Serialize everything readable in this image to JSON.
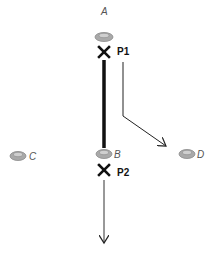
{
  "diagram": {
    "nodes": [
      {
        "id": "A",
        "label": "A",
        "x": 104,
        "y": 37,
        "label_x": 101,
        "label_y": 15
      },
      {
        "id": "B",
        "label": "B",
        "x": 104,
        "y": 154,
        "label_x": 114,
        "label_y": 158
      },
      {
        "id": "C",
        "label": "C",
        "x": 18,
        "y": 156,
        "label_x": 29,
        "label_y": 160
      },
      {
        "id": "D",
        "label": "D",
        "x": 187,
        "y": 154,
        "label_x": 197,
        "label_y": 158
      }
    ],
    "markers": [
      {
        "id": "P1",
        "label": "P1",
        "x": 104,
        "y": 52
      },
      {
        "id": "P2",
        "label": "P2",
        "x": 104,
        "y": 170
      }
    ],
    "colors": {
      "ellipse_fill": "#a9a9a9",
      "ellipse_inner": "#cfcfcf",
      "stroke": "#111111",
      "label_gray": "#555555"
    }
  }
}
